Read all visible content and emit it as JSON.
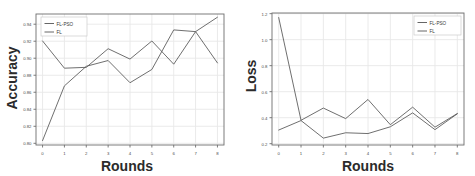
{
  "figure": {
    "background_color": "#ffffff",
    "panel_count": 2
  },
  "chart_data": [
    {
      "type": "line",
      "title": "",
      "xlabel": "Rounds",
      "ylabel": "Accuracy",
      "x": [
        0,
        1,
        2,
        3,
        4,
        5,
        6,
        7,
        8
      ],
      "xticklabels": [
        "0",
        "1",
        "2",
        "3",
        "4",
        "5",
        "6",
        "7",
        "8"
      ],
      "yticklabels": [
        "0.80",
        "0.82",
        "0.84",
        "0.86",
        "0.88",
        "0.90",
        "0.92",
        "0.94"
      ],
      "xlim": [
        -0.3,
        8.3
      ],
      "ylim": [
        0.798,
        0.952
      ],
      "grid": true,
      "legend_position": "upper left",
      "series": [
        {
          "name": "FL-PSO",
          "color": "#555555",
          "values": [
            0.8032,
            0.8675,
            0.8905,
            0.8973,
            0.8712,
            0.8868,
            0.9333,
            0.9313,
            0.9482
          ]
        },
        {
          "name": "FL",
          "color": "#555555",
          "values": [
            0.9203,
            0.8883,
            0.8893,
            0.9112,
            0.899,
            0.9203,
            0.893,
            0.9313,
            0.8945
          ]
        }
      ]
    },
    {
      "type": "line",
      "title": "",
      "xlabel": "Rounds",
      "ylabel": "Loss",
      "x": [
        0,
        1,
        2,
        3,
        4,
        5,
        6,
        7,
        8
      ],
      "xticklabels": [
        "0",
        "1",
        "2",
        "3",
        "4",
        "5",
        "6",
        "7",
        "8"
      ],
      "yticklabels": [
        "0.2",
        "0.4",
        "0.6",
        "0.8",
        "1.0",
        "1.2"
      ],
      "xlim": [
        -0.3,
        8.3
      ],
      "ylim": [
        0.19,
        1.205
      ],
      "grid": true,
      "legend_position": "upper right",
      "series": [
        {
          "name": "FL-PSO",
          "color": "#555555",
          "values": [
            0.305,
            0.378,
            0.243,
            0.284,
            0.278,
            0.33,
            0.437,
            0.308,
            0.43
          ]
        },
        {
          "name": "FL",
          "color": "#555555",
          "values": [
            1.17,
            0.38,
            0.474,
            0.393,
            0.54,
            0.346,
            0.481,
            0.327,
            0.432
          ]
        }
      ]
    }
  ],
  "panels": [
    {
      "id": "accuracy-panel",
      "ylabel": "Accuracy",
      "xlabel": "Rounds",
      "legend": [
        "FL-PSO",
        "FL"
      ]
    },
    {
      "id": "loss-panel",
      "ylabel": "Loss",
      "xlabel": "Rounds",
      "legend": [
        "FL-PSO",
        "FL"
      ]
    }
  ]
}
